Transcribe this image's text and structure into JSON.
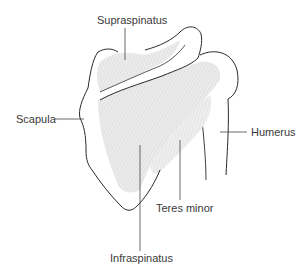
{
  "diagram": {
    "colors": {
      "outline": "#2a2a2a",
      "muscle_fill": "#e6e6e6",
      "muscle_fiber": "#bdbdbd",
      "leader_line": "#444444",
      "label_text": "#3a3a3a"
    },
    "labels": {
      "supraspinatus": "Supraspinatus",
      "scapula": "Scapula",
      "humerus": "Humerus",
      "teres_minor": "Teres minor",
      "infraspinatus": "Infraspinatus"
    }
  }
}
